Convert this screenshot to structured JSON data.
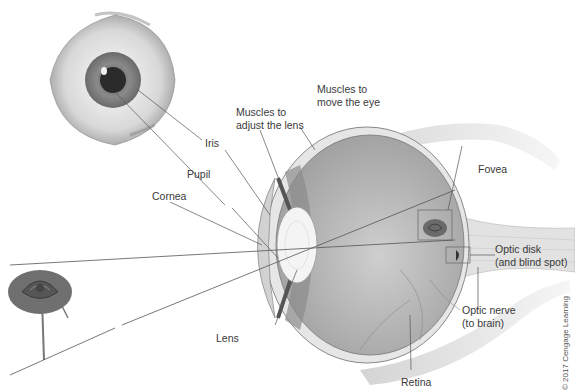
{
  "diagram": {
    "labels": {
      "muscles_move": [
        "Muscles to",
        "move the eye"
      ],
      "muscles_lens": [
        "Muscles to",
        "adjust the lens"
      ],
      "iris": "Iris",
      "pupil": "Pupil",
      "cornea": "Cornea",
      "fovea": "Fovea",
      "optic_disk": [
        "Optic disk",
        "(and blind spot)"
      ],
      "optic_nerve": [
        "Optic nerve",
        "(to brain)"
      ],
      "lens": "Lens",
      "retina": "Retina"
    },
    "copyright": "© 2017 Cengage Learning",
    "colors": {
      "line": "#555555",
      "text": "#3a3a3a",
      "vitreous": "#bdbdbd",
      "sclera": "#e6e6e6",
      "lens": "#f4f4f4"
    }
  }
}
